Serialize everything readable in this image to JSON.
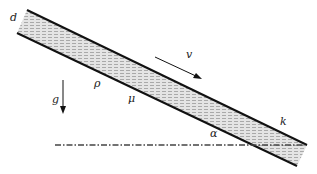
{
  "diagram": {
    "labels": {
      "thickness": "d",
      "velocity": "v",
      "gravity": "g",
      "density": "ρ",
      "viscosity": "μ",
      "angle": "α",
      "surface": "k"
    },
    "colors": {
      "line": "#111111",
      "fill": "#cfcfcf",
      "dashdot": "#444444"
    }
  }
}
